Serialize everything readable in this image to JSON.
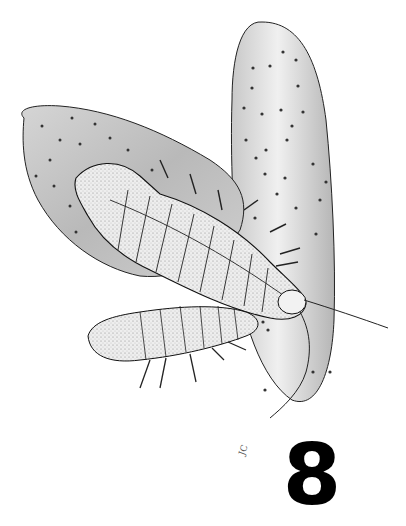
{
  "figure": {
    "number": "8",
    "signature": "JC",
    "colors": {
      "background": "#ffffff",
      "ink": "#1a1a1a",
      "pad_shade": "#bdbdbd",
      "pad_light": "#e6e6e6",
      "body_light": "#f2f2f2"
    }
  }
}
